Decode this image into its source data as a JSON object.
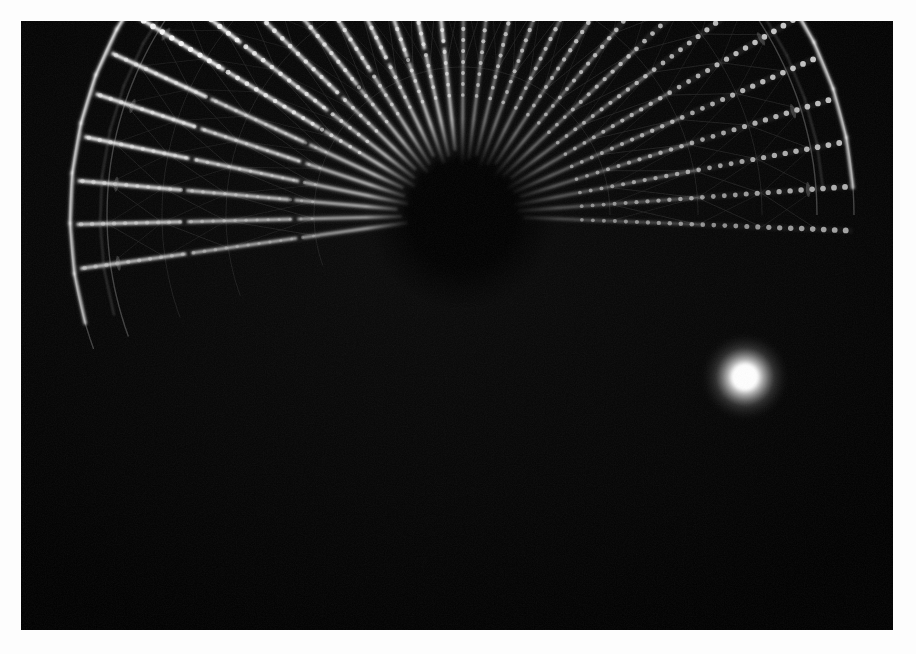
{
  "scene": {
    "subject": "ferris-wheel",
    "setting": "night",
    "alt_text": "Night photograph of an illuminated Ferris wheel seen from below, its lit spokes radiating from a dark central hub",
    "border_color": "#fdfdfd",
    "sky_color": "#000000",
    "light_color": "#ffffff",
    "dim_light_color": "#6e6e6e",
    "cable_color": "#2a2a2a"
  },
  "photo": {
    "frame_width": 916,
    "frame_height": 654,
    "image_left": 21,
    "image_top": 21,
    "image_width": 872,
    "image_height": 609,
    "border_width": 21
  },
  "wheel": {
    "hub_x": 441,
    "hub_y": 194,
    "hub_radius": 34,
    "rim_radius": 392,
    "inner_ring_radius": 300,
    "spoke_count": 30,
    "spoke_start_angle_deg": -188,
    "spoke_end_angle_deg": 8,
    "cabin_ring_radius": 355,
    "bulb_spacing": 11,
    "bulb_radius": 2.6
  },
  "highlight": {
    "label": "blown-out-lamp",
    "x": 724,
    "y": 356,
    "core_radius": 15,
    "glow_radius": 46,
    "color": "#ffffff"
  },
  "chart_data": {
    "type": "scatter",
    "xlabel": "",
    "ylabel": "",
    "legend": [],
    "hub": {
      "x": 441,
      "y": 194
    },
    "spoke_angles_deg": [
      -188,
      -181.4,
      -174.9,
      -168.3,
      -161.7,
      -155.2,
      -148.6,
      -142.1,
      -135.5,
      -128.9,
      -122.4,
      -115.8,
      -109.2,
      -102.7,
      -96.1,
      -89.6,
      -83.0,
      -76.4,
      -69.9,
      -63.3,
      -56.7,
      -50.2,
      -43.6,
      -37.1,
      -30.5,
      -23.9,
      -17.4,
      -10.8,
      -4.2,
      2.3
    ],
    "spoke_brightness": [
      0.55,
      0.62,
      0.78,
      0.9,
      0.95,
      0.98,
      1.0,
      0.96,
      0.92,
      0.88,
      0.86,
      0.9,
      0.94,
      0.97,
      1.0,
      0.98,
      0.95,
      0.92,
      0.9,
      0.88,
      0.86,
      0.84,
      0.82,
      0.8,
      0.78,
      0.74,
      0.7,
      0.66,
      0.6,
      0.52
    ],
    "rim_arc_start_deg": -196,
    "rim_arc_end_deg": -4,
    "rim_radius": 392,
    "ring_radii": [
      148,
      236,
      300,
      355,
      392
    ]
  }
}
